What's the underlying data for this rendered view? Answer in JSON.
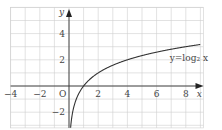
{
  "chart_data": {
    "type": "line",
    "title": "",
    "xlabel": "x",
    "ylabel": "y",
    "origin_label": "O",
    "xlim": [
      -4,
      9.2
    ],
    "ylim": [
      -3.2,
      6
    ],
    "grid": true,
    "grid_step": 1,
    "x_ticks": [
      -4,
      -2,
      2,
      4,
      6,
      8
    ],
    "x_tick_labels": [
      "−4",
      "−2",
      "2",
      "4",
      "6",
      "8"
    ],
    "y_ticks": [
      4,
      2,
      -2
    ],
    "y_tick_labels": [
      "4",
      "2",
      "−2"
    ],
    "series": [
      {
        "name": "y=log₂ x",
        "function": "log2(x)",
        "x": [
          0.11,
          0.25,
          0.5,
          1,
          2,
          3,
          4,
          5,
          6,
          7,
          8,
          9
        ],
        "values": [
          -3.18,
          -2,
          -1,
          0,
          1,
          1.58,
          2,
          2.32,
          2.58,
          2.81,
          3,
          3.17
        ]
      }
    ],
    "annotations": [
      {
        "text": "y=log₂ x",
        "x": 6.9,
        "y": 2.1
      }
    ]
  },
  "colors": {
    "grid": "#cfcfcf",
    "axis": "#333333",
    "curve": "#333333",
    "text": "#444444"
  }
}
